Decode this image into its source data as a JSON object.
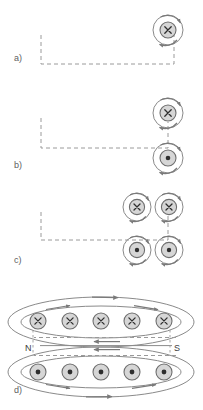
{
  "figure": {
    "width": 203,
    "height": 410,
    "background": "#ffffff",
    "colors": {
      "wire_dashed": "#9a9a9a",
      "conductor_fill": "#d6d6d6",
      "conductor_stroke": "#6e6e6e",
      "field_line": "#8a8a8a",
      "arrow": "#7a7a7a",
      "text": "#606060",
      "pole_text": "#3d3d3d"
    },
    "panels": [
      {
        "id": "a",
        "label": "a)",
        "label_x": 14,
        "label_y": 54,
        "description": "Single straight conductor with current into the page, surrounded by one circular magnetic field line",
        "wire": {
          "style": "dashed",
          "points": [
            [
              41,
              35
            ],
            [
              41,
              64
            ],
            [
              174,
              64
            ],
            [
              174,
              31
            ]
          ]
        },
        "conductors": [
          {
            "cx": 168,
            "cy": 30,
            "r": 8,
            "symbol": "x",
            "symbol_label": "current-into-page",
            "field_radius": 15,
            "field_direction": "clockwise",
            "arrow_angle_deg": -50
          }
        ]
      },
      {
        "id": "b",
        "label": "b)",
        "label_x": 14,
        "label_y": 161,
        "description": "Two conductors forming a loop: top current into the page, bottom current out of the page",
        "wire": {
          "style": "dashed",
          "points": [
            [
              41,
              118
            ],
            [
              41,
              148
            ],
            [
              168,
              148
            ],
            [
              168,
              118
            ]
          ]
        },
        "conductors": [
          {
            "cx": 168,
            "cy": 113,
            "r": 8,
            "symbol": "x",
            "symbol_label": "current-into-page",
            "field_radius": 15,
            "field_direction": "clockwise",
            "arrow_angle_deg": -50
          },
          {
            "cx": 168,
            "cy": 158,
            "r": 8,
            "symbol": "dot",
            "symbol_label": "current-out-of-page",
            "field_radius": 15,
            "field_direction": "counterclockwise",
            "arrow_angle_deg": -50
          }
        ]
      },
      {
        "id": "c",
        "label": "c)",
        "label_x": 14,
        "label_y": 256,
        "description": "Two-turn coil: two conductors with current into the page above two conductors with current out of the page",
        "wire": {
          "style": "dashed",
          "points": [
            [
              41,
              212
            ],
            [
              41,
              240
            ],
            [
              168,
              240
            ],
            [
              168,
              212
            ]
          ]
        },
        "conductors": [
          {
            "cx": 137,
            "cy": 207,
            "r": 8,
            "symbol": "x",
            "symbol_label": "current-into-page",
            "field_radius": 15,
            "field_direction": "clockwise",
            "arrow_angle_deg": -50
          },
          {
            "cx": 169,
            "cy": 207,
            "r": 8,
            "symbol": "x",
            "symbol_label": "current-into-page",
            "field_radius": 15,
            "field_direction": "clockwise",
            "arrow_angle_deg": -50
          },
          {
            "cx": 137,
            "cy": 250,
            "r": 8,
            "symbol": "dot",
            "symbol_label": "current-out-of-page",
            "field_radius": 15,
            "field_direction": "counterclockwise",
            "arrow_angle_deg": -50
          },
          {
            "cx": 169,
            "cy": 250,
            "r": 8,
            "symbol": "dot",
            "symbol_label": "current-out-of-page",
            "field_radius": 15,
            "field_direction": "counterclockwise",
            "arrow_angle_deg": -50
          }
        ]
      },
      {
        "id": "d",
        "label": "d)",
        "label_x": 14,
        "label_y": 386,
        "description": "Solenoid cross-section: upper row of five conductors with current into the page, lower row of five conductors with current out of the page, with surrounding magnetic field loops and magnetic poles marked",
        "pole_labels": [
          {
            "text": "N",
            "x": 25,
            "y": 344
          },
          {
            "text": "S",
            "x": 174,
            "y": 344
          }
        ],
        "top_row": {
          "symbol": "x",
          "symbol_label": "current-into-page",
          "cy": 321,
          "r": 8,
          "xs": [
            38,
            70,
            101,
            132,
            164
          ]
        },
        "bottom_row": {
          "symbol": "dot",
          "symbol_label": "current-out-of-page",
          "cy": 372,
          "r": 8,
          "xs": [
            38,
            70,
            101,
            132,
            164
          ]
        },
        "field_loops": [
          {
            "cx": 101,
            "cy": 321,
            "rx": 92,
            "ry": 24,
            "arrow_side": "top",
            "arrow_dir": "right"
          },
          {
            "cx": 101,
            "cy": 321,
            "rx": 80,
            "ry": 16,
            "arrow_side": "top",
            "arrow_dir": "right"
          },
          {
            "cx": 101,
            "cy": 372,
            "rx": 92,
            "ry": 24,
            "arrow_side": "bottom",
            "arrow_dir": "right"
          },
          {
            "cx": 101,
            "cy": 372,
            "rx": 80,
            "ry": 16,
            "arrow_side": "bottom",
            "arrow_dir": "right"
          }
        ],
        "axis_lines": [
          {
            "y": 337,
            "from_x": 30,
            "to_x": 176,
            "style": "dashed",
            "arrow_dir": "left"
          },
          {
            "y": 356,
            "from_x": 30,
            "to_x": 176,
            "style": "dashed",
            "arrow_dir": "left"
          }
        ],
        "pole_ticks": [
          {
            "x": 33,
            "y1": 330,
            "y2": 356
          },
          {
            "x": 170,
            "y1": 330,
            "y2": 356
          }
        ]
      }
    ]
  }
}
